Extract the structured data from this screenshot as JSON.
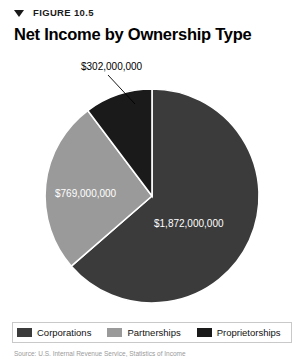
{
  "figure": {
    "eyebrow": "FIGURE 10.5",
    "title": "Net Income by Ownership Type",
    "disclosure_icon": "triangle-down-icon",
    "source_note": "Source: U.S. Internal Revenue Service, Statistics of Income"
  },
  "colors": {
    "corporations": "#3b3b3b",
    "partnerships": "#9a9a9a",
    "proprietorships": "#1a1a1a",
    "slice_divider": "#ffffff",
    "label_on_dark": "#ffffff",
    "callout_text": "#000000",
    "legend_border": "#c9c9c9",
    "background": "#ffffff"
  },
  "legend": {
    "position": "bottom",
    "items": [
      {
        "label": "Corporations",
        "color": "#3b3b3b",
        "swatch_name": "legend-swatch-corporations"
      },
      {
        "label": "Partnerships",
        "color": "#9a9a9a",
        "swatch_name": "legend-swatch-partnerships"
      },
      {
        "label": "Proprietorships",
        "color": "#1a1a1a",
        "swatch_name": "legend-swatch-proprietorships"
      }
    ]
  },
  "labels": {
    "corporations_value": "$1,872,000,000",
    "partnerships_value": "$769,000,000",
    "proprietorships_value": "$302,000,000"
  },
  "chart_data": {
    "type": "pie",
    "title": "Net Income by Ownership Type",
    "subtitle": "FIGURE 10.5",
    "xlabel": "",
    "ylabel": "",
    "unit": "US dollars",
    "total": 2943000000,
    "start_angle_deg": 0,
    "direction": "clockwise",
    "grid": false,
    "legend_position": "bottom",
    "categories": [
      "Corporations",
      "Partnerships",
      "Proprietorships"
    ],
    "values": [
      1872000000,
      769000000,
      302000000
    ],
    "value_labels": [
      "$1,872,000,000",
      "$769,000,000",
      "$302,000,000"
    ],
    "percentages": [
      63.6,
      26.1,
      10.3
    ],
    "colors": [
      "#3b3b3b",
      "#9a9a9a",
      "#1a1a1a"
    ],
    "slices": [
      {
        "name": "Corporations",
        "value": 1872000000,
        "label": "$1,872,000,000",
        "percent": 63.6,
        "color": "#3b3b3b",
        "start_deg": 0,
        "end_deg": 229.0,
        "label_placement": "inside"
      },
      {
        "name": "Partnerships",
        "value": 769000000,
        "label": "$769,000,000",
        "percent": 26.1,
        "color": "#9a9a9a",
        "start_deg": 229.0,
        "end_deg": 323.0,
        "label_placement": "inside"
      },
      {
        "name": "Proprietorships",
        "value": 302000000,
        "label": "$302,000,000",
        "percent": 10.3,
        "color": "#1a1a1a",
        "start_deg": 323.0,
        "end_deg": 360.0,
        "label_placement": "callout-above"
      }
    ]
  }
}
